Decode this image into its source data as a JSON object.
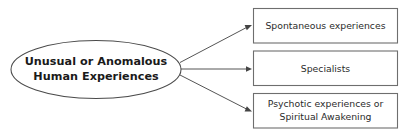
{
  "diagram": {
    "type": "flowchart",
    "background_color": "#ffffff",
    "source_node": {
      "shape": "ellipse",
      "lines": [
        "Unusual or Anomalous",
        "Human Experiences"
      ],
      "text_color": "#1a1a1a",
      "border_color": "#4a4a4a",
      "fill_color": "#ffffff"
    },
    "target_nodes": [
      {
        "shape": "rectangle",
        "lines": [
          "Spontaneous experiences"
        ],
        "text_color": "#2b2b2b",
        "border_color": "#6e6e6e",
        "fill_color": "#ffffff"
      },
      {
        "shape": "rectangle",
        "lines": [
          "Specialists"
        ],
        "text_color": "#2b2b2b",
        "border_color": "#6e6e6e",
        "fill_color": "#ffffff"
      },
      {
        "shape": "rectangle",
        "lines": [
          "Psychotic experiences or",
          "Spiritual Awakening"
        ],
        "text_color": "#2b2b2b",
        "border_color": "#6e6e6e",
        "fill_color": "#ffffff"
      }
    ],
    "connectors": [
      {
        "from": "source_node",
        "to": "target_nodes.0",
        "style": "arrow",
        "color": "#555555"
      },
      {
        "from": "source_node",
        "to": "target_nodes.1",
        "style": "arrow",
        "color": "#555555"
      },
      {
        "from": "source_node",
        "to": "target_nodes.2",
        "style": "arrow",
        "color": "#555555"
      }
    ]
  }
}
